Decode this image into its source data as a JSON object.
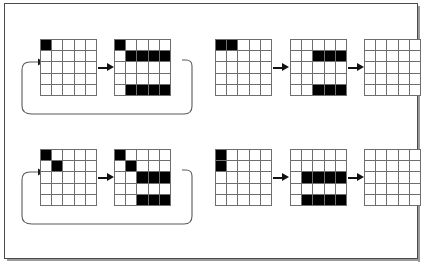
{
  "figure": {
    "grid_rows": 5,
    "grid_cols": 5,
    "colors": {
      "cell_on": "#000000",
      "cell_off": "#ffffff",
      "grid_line": "#6e6e6e",
      "frame": "#4a4a4a",
      "arrow": "#111111",
      "background": "#ffffff"
    }
  },
  "groups": [
    {
      "id": "group-top-left",
      "has_feedback_loop": true,
      "loop_label": "",
      "grids": [
        {
          "id": "grid-tl-1",
          "label": "",
          "cells": [
            [
              1,
              0,
              0,
              0,
              0
            ],
            [
              0,
              0,
              0,
              0,
              0
            ],
            [
              0,
              0,
              0,
              0,
              0
            ],
            [
              0,
              0,
              0,
              0,
              0
            ],
            [
              0,
              0,
              0,
              0,
              0
            ]
          ]
        },
        {
          "id": "grid-tl-2",
          "label": "",
          "cells": [
            [
              1,
              0,
              0,
              0,
              0
            ],
            [
              0,
              1,
              1,
              1,
              1
            ],
            [
              0,
              0,
              0,
              0,
              0
            ],
            [
              0,
              0,
              0,
              0,
              0
            ],
            [
              0,
              1,
              1,
              1,
              1
            ]
          ]
        }
      ],
      "arrows": [
        {
          "id": "arrow-tl-1",
          "direction": "right"
        }
      ]
    },
    {
      "id": "group-top-right",
      "has_feedback_loop": false,
      "loop_label": "",
      "grids": [
        {
          "id": "grid-tr-1",
          "label": "",
          "cells": [
            [
              1,
              1,
              0,
              0,
              0
            ],
            [
              0,
              0,
              0,
              0,
              0
            ],
            [
              0,
              0,
              0,
              0,
              0
            ],
            [
              0,
              0,
              0,
              0,
              0
            ],
            [
              0,
              0,
              0,
              0,
              0
            ]
          ]
        },
        {
          "id": "grid-tr-2",
          "label": "",
          "cells": [
            [
              0,
              0,
              0,
              0,
              0
            ],
            [
              0,
              0,
              1,
              1,
              1
            ],
            [
              0,
              0,
              0,
              0,
              0
            ],
            [
              0,
              0,
              0,
              0,
              0
            ],
            [
              0,
              0,
              1,
              1,
              1
            ]
          ]
        },
        {
          "id": "grid-tr-3",
          "label": "",
          "cells": [
            [
              0,
              0,
              0,
              0,
              0
            ],
            [
              0,
              0,
              0,
              0,
              0
            ],
            [
              0,
              0,
              0,
              0,
              0
            ],
            [
              0,
              0,
              0,
              0,
              0
            ],
            [
              0,
              0,
              0,
              0,
              0
            ]
          ]
        }
      ],
      "arrows": [
        {
          "id": "arrow-tr-1",
          "direction": "right"
        },
        {
          "id": "arrow-tr-2",
          "direction": "right"
        }
      ]
    },
    {
      "id": "group-bottom-left",
      "has_feedback_loop": true,
      "loop_label": "",
      "grids": [
        {
          "id": "grid-bl-1",
          "label": "",
          "cells": [
            [
              1,
              0,
              0,
              0,
              0
            ],
            [
              0,
              1,
              0,
              0,
              0
            ],
            [
              0,
              0,
              0,
              0,
              0
            ],
            [
              0,
              0,
              0,
              0,
              0
            ],
            [
              0,
              0,
              0,
              0,
              0
            ]
          ]
        },
        {
          "id": "grid-bl-2",
          "label": "",
          "cells": [
            [
              1,
              0,
              0,
              0,
              0
            ],
            [
              0,
              1,
              0,
              0,
              0
            ],
            [
              0,
              0,
              1,
              1,
              1
            ],
            [
              0,
              0,
              0,
              0,
              0
            ],
            [
              0,
              0,
              1,
              1,
              1
            ]
          ]
        }
      ],
      "arrows": [
        {
          "id": "arrow-bl-1",
          "direction": "right"
        }
      ]
    },
    {
      "id": "group-bottom-right",
      "has_feedback_loop": false,
      "loop_label": "",
      "grids": [
        {
          "id": "grid-br-1",
          "label": "",
          "cells": [
            [
              1,
              0,
              0,
              0,
              0
            ],
            [
              1,
              0,
              0,
              0,
              0
            ],
            [
              0,
              0,
              0,
              0,
              0
            ],
            [
              0,
              0,
              0,
              0,
              0
            ],
            [
              0,
              0,
              0,
              0,
              0
            ]
          ]
        },
        {
          "id": "grid-br-2",
          "label": "",
          "cells": [
            [
              0,
              0,
              0,
              0,
              0
            ],
            [
              0,
              0,
              0,
              0,
              0
            ],
            [
              0,
              1,
              1,
              1,
              1
            ],
            [
              0,
              0,
              0,
              0,
              0
            ],
            [
              0,
              1,
              1,
              1,
              1
            ]
          ]
        },
        {
          "id": "grid-br-3",
          "label": "",
          "cells": [
            [
              0,
              0,
              0,
              0,
              0
            ],
            [
              0,
              0,
              0,
              0,
              0
            ],
            [
              0,
              0,
              0,
              0,
              0
            ],
            [
              0,
              0,
              0,
              0,
              0
            ],
            [
              0,
              0,
              0,
              0,
              0
            ]
          ]
        }
      ],
      "arrows": [
        {
          "id": "arrow-br-1",
          "direction": "right"
        },
        {
          "id": "arrow-br-2",
          "direction": "right"
        }
      ]
    }
  ]
}
